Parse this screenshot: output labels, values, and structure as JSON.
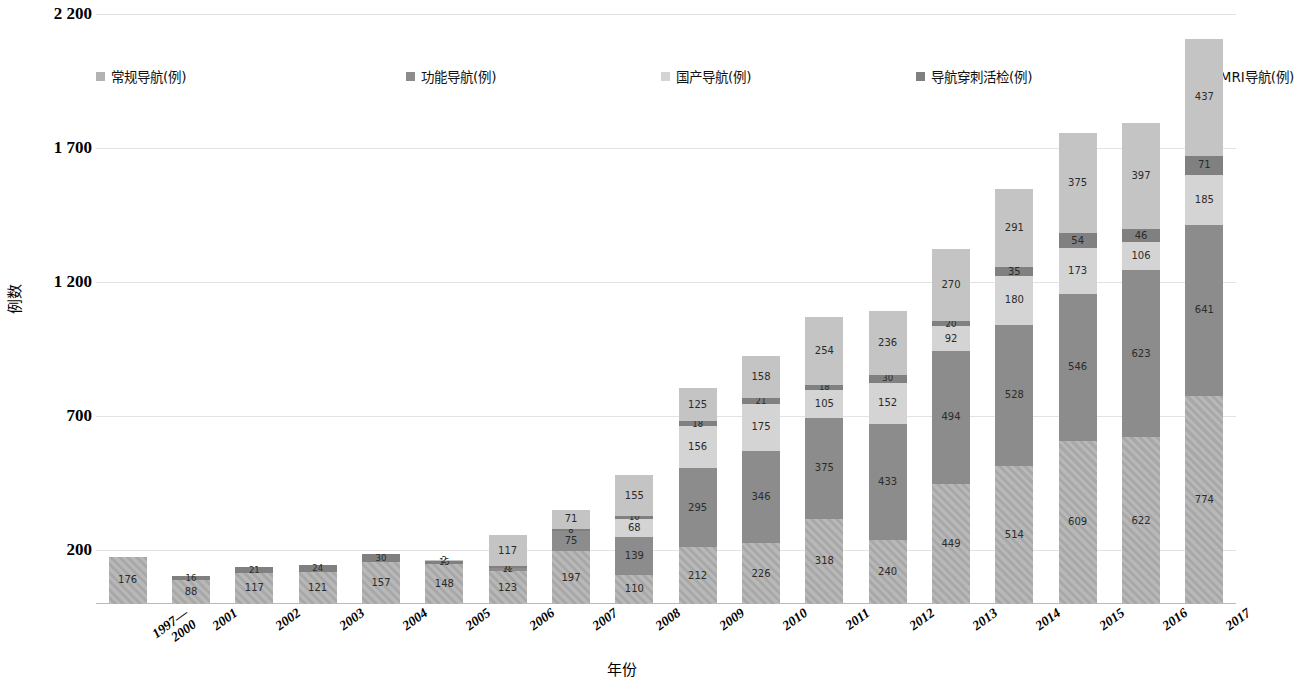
{
  "chart_data": {
    "type": "bar",
    "stacked": true,
    "title": "",
    "xlabel": "年份",
    "ylabel": "例数",
    "ylim": [
      0,
      2200
    ],
    "yticks": [
      "200",
      "700",
      "1 200",
      "1 700",
      "2 200"
    ],
    "ytick_values": [
      200,
      700,
      1200,
      1700,
      2200
    ],
    "grid": true,
    "legend_position": "top",
    "categories": [
      "1997—\n2000",
      "2001",
      "2002",
      "2003",
      "2004",
      "2005",
      "2006",
      "2007",
      "2008",
      "2009",
      "2010",
      "2011",
      "2012",
      "2013",
      "2014",
      "2015",
      "2016",
      "2017"
    ],
    "series": [
      {
        "name": "常规导航(例)",
        "color": "#b3b3b3",
        "pattern": "diagonal-hatch",
        "values": [
          176,
          88,
          117,
          121,
          157,
          148,
          123,
          197,
          110,
          212,
          226,
          318,
          240,
          449,
          514,
          609,
          622,
          774
        ]
      },
      {
        "name": "功能导航(例)",
        "color": "#8c8c8c",
        "pattern": "solid",
        "values": [
          0,
          0,
          0,
          0,
          0,
          0,
          12,
          75,
          139,
          295,
          346,
          375,
          433,
          494,
          528,
          546,
          623,
          641
        ]
      },
      {
        "name": "国产导航(例)",
        "color": "#d4d4d4",
        "pattern": "solid",
        "values": [
          0,
          0,
          0,
          0,
          0,
          0,
          0,
          0,
          68,
          156,
          175,
          105,
          152,
          92,
          180,
          173,
          106,
          185
        ]
      },
      {
        "name": "导航穿刺活检(例)",
        "color": "#808080",
        "pattern": "solid",
        "values": [
          0,
          16,
          21,
          24,
          30,
          15,
          6,
          8,
          10,
          18,
          21,
          18,
          30,
          20,
          35,
          54,
          46,
          71
        ]
      },
      {
        "name": "iMRI导航(例)",
        "color": "#c4c4c4",
        "pattern": "solid",
        "values": [
          0,
          0,
          0,
          0,
          0,
          2,
          117,
          71,
          155,
          125,
          158,
          254,
          236,
          270,
          291,
          375,
          397,
          437
        ]
      }
    ],
    "visible_labels": {
      "1997—\n2000": [
        "176"
      ],
      "2001": [
        "88",
        "16"
      ],
      "2002": [
        "117",
        "21"
      ],
      "2003": [
        "121",
        "24"
      ],
      "2004": [
        "157",
        "30"
      ],
      "2005": [
        "148",
        "15",
        "2"
      ],
      "2006": [
        "123",
        "12",
        "6",
        "117"
      ],
      "2007": [
        "197",
        "75",
        "8",
        "71"
      ],
      "2008": [
        "110",
        "139",
        "68",
        "10",
        "155"
      ],
      "2009": [
        "212",
        "295",
        "156",
        "18",
        "125"
      ],
      "2010": [
        "226",
        "346",
        "175",
        "21",
        "158"
      ],
      "2011": [
        "318",
        "375",
        "105",
        "18",
        "254"
      ],
      "2012": [
        "240",
        "433",
        "152",
        "30",
        "236"
      ],
      "2013": [
        "449",
        "494",
        "92",
        "20",
        "270"
      ],
      "2014": [
        "514",
        "528",
        "180",
        "35",
        "291"
      ],
      "2015": [
        "609",
        "546",
        "173",
        "54",
        "375"
      ],
      "2016": [
        "622",
        "623",
        "106",
        "46",
        "397"
      ],
      "2017": [
        "774",
        "641",
        "185",
        "71",
        "437"
      ]
    }
  }
}
